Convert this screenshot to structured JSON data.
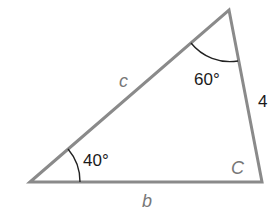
{
  "diagram": {
    "type": "triangle",
    "vertices": {
      "bottom_left": {
        "x": 30,
        "y": 182
      },
      "top": {
        "x": 229,
        "y": 10
      },
      "bottom_right": {
        "x": 262,
        "y": 182
      }
    },
    "colors": {
      "sides": "#8a8a8a",
      "arcs": "#222222",
      "numbers": "#1a1a1a",
      "variables": "#777777"
    },
    "labels": {
      "side_c": "c",
      "side_b": "b",
      "side_a": "4",
      "angle_bottom_left": "40°",
      "angle_top": "60°",
      "angle_bottom_right": "C"
    }
  }
}
